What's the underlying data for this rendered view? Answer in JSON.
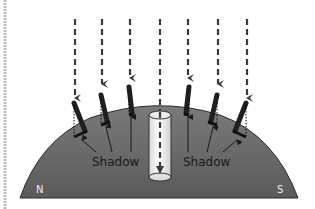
{
  "diagram": {
    "title": "",
    "labels": {
      "shadow_left": "Shadow",
      "shadow_right": "Shadow",
      "north": "N",
      "south": "S"
    },
    "colors": {
      "ground": "#6e6e6e",
      "ground_dark": "#4a4a4a",
      "arrow": "#3a3a3a",
      "stick": "#2e2e2e",
      "cylinder": "#f2f2f2",
      "text_dark": "#1a1a1a",
      "text_light": "#f0f0f0",
      "side_bar": "#bdbdbd"
    },
    "elements": {
      "sun_rays": [
        "ray-1",
        "ray-2",
        "ray-3",
        "ray-center",
        "ray-5",
        "ray-6",
        "ray-7"
      ],
      "sticks": [
        "stick-1",
        "stick-2",
        "stick-3",
        "stick-4",
        "stick-5",
        "stick-6"
      ],
      "well": "vertical-well-cylinder"
    }
  }
}
